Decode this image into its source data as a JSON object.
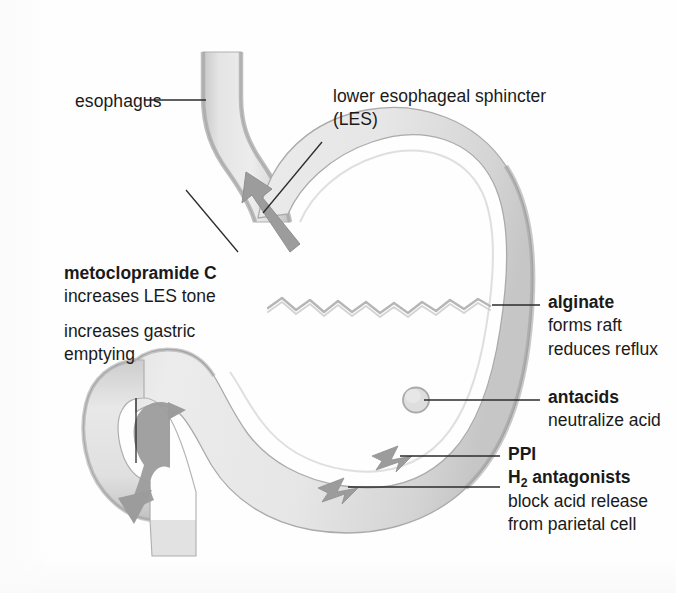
{
  "figure": {
    "background_color": "#fdfdfd",
    "ink_color": "#1a1a1a",
    "organ_fill": "#e9e9e9",
    "organ_wall": "#b9b9b9",
    "organ_wall_dark": "#a2a2a2",
    "arrow_color": "#9a9a9a",
    "leader_color": "#2b2b2b"
  },
  "anatomy_labels": {
    "esophagus": "esophagus",
    "les_line1": "lower esophageal sphincter",
    "les_line2": "(LES)"
  },
  "drug_blocks": [
    {
      "id": "metoclopramide",
      "heading": "metoclopramide C",
      "effects": [
        "increases LES tone",
        "increases gastric",
        "emptying"
      ]
    },
    {
      "id": "alginate",
      "heading": "alginate",
      "effects": [
        "forms raft",
        "reduces reflux"
      ]
    },
    {
      "id": "antacids",
      "heading": "antacids",
      "effects": [
        "neutralize acid"
      ]
    },
    {
      "id": "acid-suppression",
      "heading_ppi": "PPI",
      "heading_h2_prefix": "H",
      "heading_h2_sub": "2",
      "heading_h2_suffix": " antagonists",
      "effects": [
        "block acid release",
        "from parietal cell"
      ]
    }
  ],
  "graphic_elements": {
    "stomach": "stomach-body",
    "esophagus_tube": "esophagus-tube",
    "duodenum": "duodenum-tube",
    "alginate_raft": "alginate-raft-zigzag",
    "antacid_particle": "antacid-particle-circle",
    "reflux_arrow": "reflux-arrow-upward",
    "emptying_arrow": "gastric-emptying-arrow-downward",
    "parietal_arrow_upper": "parietal-cell-arrow-upper",
    "parietal_arrow_lower": "parietal-cell-arrow-lower"
  }
}
